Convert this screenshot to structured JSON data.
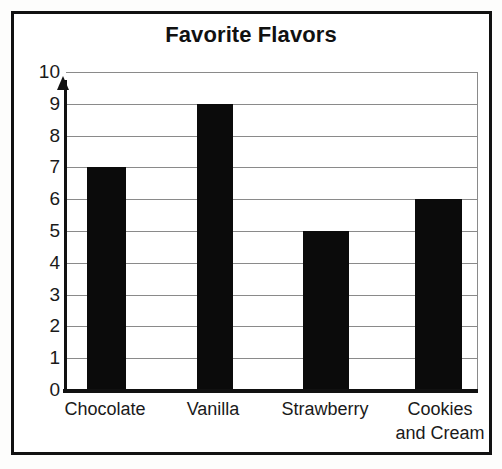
{
  "chart_data": {
    "type": "bar",
    "title": "Favorite Flavors",
    "categories": [
      "Chocolate",
      "Vanilla",
      "Strawberry",
      "Cookies\nand Cream"
    ],
    "values": [
      7,
      9,
      5,
      6
    ],
    "xlabel": "",
    "ylabel": "",
    "ylim": [
      0,
      10
    ],
    "yticks": [
      "10",
      "9",
      "8",
      "7",
      "6",
      "5",
      "4",
      "3",
      "2",
      "1",
      "0"
    ],
    "grid": true,
    "legend": "none",
    "bar_color": "#0b0b0b",
    "axis_color": "#111111",
    "gridline_color": "#8a8a8a",
    "background": "#ffffff"
  }
}
